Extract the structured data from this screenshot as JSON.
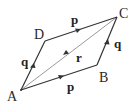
{
  "diagram": {
    "type": "parallelogram-vectors",
    "colors": {
      "edge": "#333333",
      "diagonal": "#9a9a9a",
      "text": "#222222",
      "background": "#ffffff"
    },
    "vertices": {
      "A": {
        "label": "A",
        "x": 21,
        "y": 90
      },
      "B": {
        "label": "B",
        "x": 97,
        "y": 65
      },
      "C": {
        "label": "C",
        "x": 117,
        "y": 17
      },
      "D": {
        "label": "D",
        "x": 45,
        "y": 41
      }
    },
    "edges": [
      {
        "from": "A",
        "to": "B",
        "vector": "p"
      },
      {
        "from": "B",
        "to": "C",
        "vector": "q"
      },
      {
        "from": "A",
        "to": "D",
        "vector": "q"
      },
      {
        "from": "D",
        "to": "C",
        "vector": "p"
      },
      {
        "from": "A",
        "to": "C",
        "vector": "r",
        "diagonal": true
      }
    ],
    "labels": {
      "vertex_A": "A",
      "vertex_B": "B",
      "vertex_C": "C",
      "vertex_D": "D",
      "vec_p_top": "p",
      "vec_p_bottom": "p",
      "vec_q_left": "q",
      "vec_q_right": "q",
      "vec_r": "r"
    }
  }
}
